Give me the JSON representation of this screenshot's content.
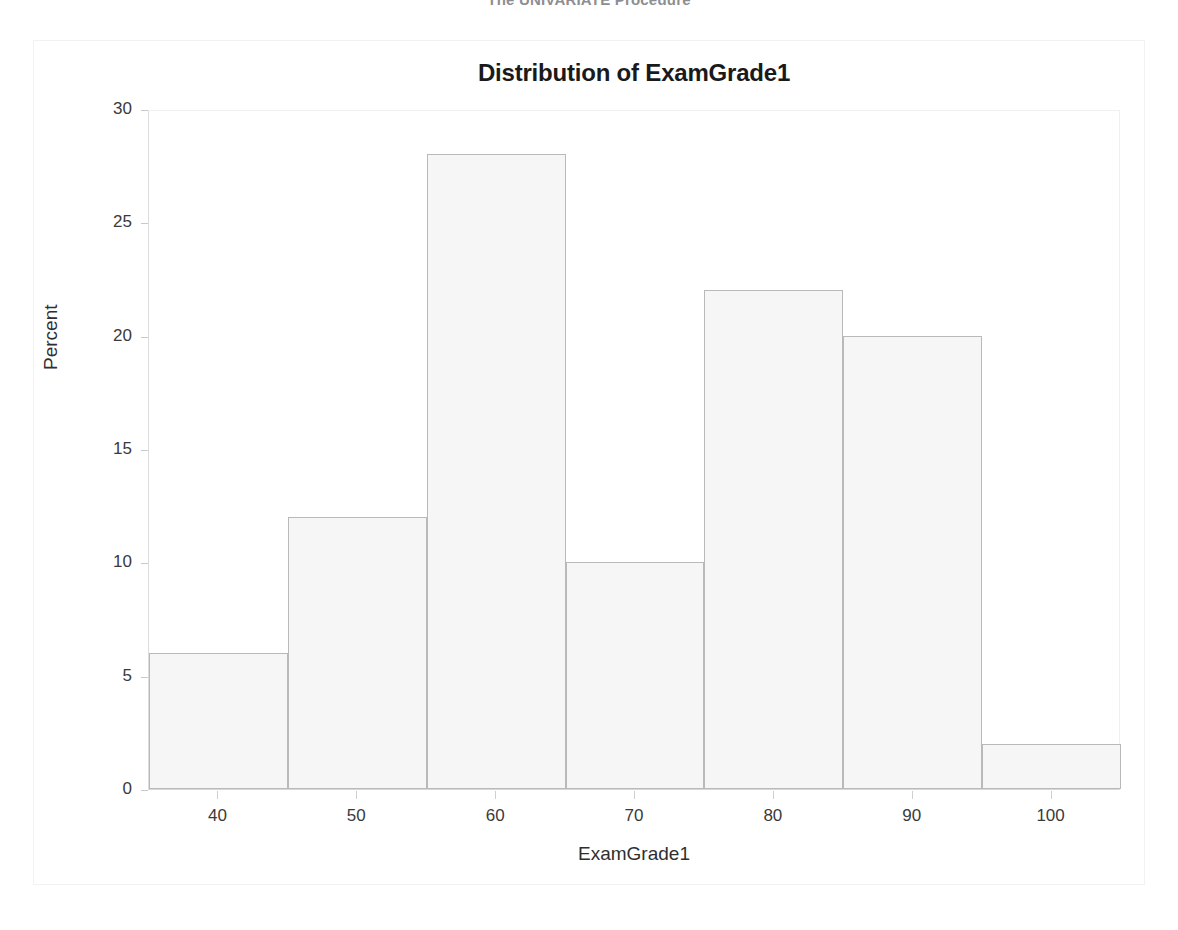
{
  "page": {
    "procedure_heading": "The UNIVARIATE Procedure",
    "background_color": "#ffffff",
    "frame_border_color": "#f2f2f2"
  },
  "chart_data": {
    "type": "bar",
    "title": "Distribution of ExamGrade1",
    "xlabel": "ExamGrade1",
    "ylabel": "Percent",
    "grid": false,
    "legend": null,
    "histogram": true,
    "bin_width": 10,
    "xlim": [
      35,
      105
    ],
    "ylim": [
      0,
      30
    ],
    "xticks": [
      40,
      50,
      60,
      70,
      80,
      90,
      100
    ],
    "yticks": [
      0,
      5,
      10,
      15,
      20,
      25,
      30
    ],
    "bin_edges": [
      35,
      45,
      55,
      65,
      75,
      85,
      95,
      105
    ],
    "bin_midpoints": [
      40,
      50,
      60,
      70,
      80,
      90,
      100
    ],
    "categories": [
      "40",
      "50",
      "60",
      "70",
      "80",
      "90",
      "100"
    ],
    "values": [
      6,
      12,
      28,
      10,
      22,
      20,
      2
    ],
    "bar_fill_color": "#f6f6f6",
    "bar_border_color": "#b9b9b9"
  }
}
